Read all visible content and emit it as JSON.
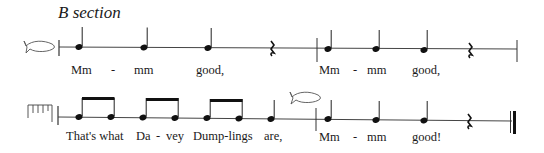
{
  "section_title": "B section",
  "lines": [
    {
      "start_symbol": "fish-icon",
      "lyrics": [
        {
          "text": "Mm",
          "x": 71
        },
        {
          "text": "-",
          "x": 111
        },
        {
          "text": "mm",
          "x": 134
        },
        {
          "text": "good,",
          "x": 196
        },
        {
          "text": "Mm",
          "x": 319
        },
        {
          "text": "-",
          "x": 353
        },
        {
          "text": "mm",
          "x": 367
        },
        {
          "text": "good,",
          "x": 412
        }
      ]
    },
    {
      "start_symbol": "rake-icon",
      "lyrics": [
        {
          "text": "That's what",
          "x": 66
        },
        {
          "text": "Da",
          "x": 136
        },
        {
          "text": "-",
          "x": 156
        },
        {
          "text": "vey",
          "x": 166
        },
        {
          "text": "Dump-lings",
          "x": 193
        },
        {
          "text": "are,",
          "x": 264
        },
        {
          "text": "Mm",
          "x": 319
        },
        {
          "text": "-",
          "x": 353
        },
        {
          "text": "mm",
          "x": 367
        },
        {
          "text": "good!",
          "x": 412
        }
      ]
    }
  ]
}
